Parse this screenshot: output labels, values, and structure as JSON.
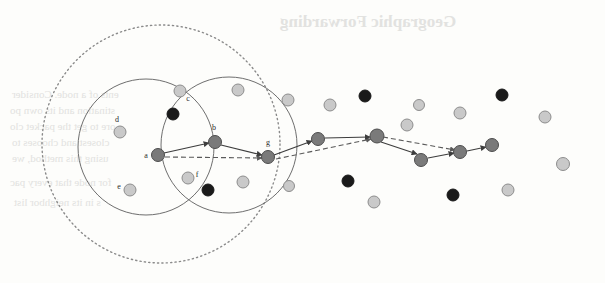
{
  "figure": {
    "background_color": "#fdfdfb",
    "colors": {
      "light_node": "#c9c9c9",
      "light_node_stroke": "#8d8d8d",
      "mid_node": "#7a7a7a",
      "mid_node_stroke": "#4d4d4d",
      "dark_node": "#1a1a1a",
      "circle_stroke": "#6e6e6e",
      "dotted_stroke": "#8a8a8a",
      "edge_solid": "#3d3d3d",
      "edge_dashed": "#5a5a5a",
      "label_color": "#2b2b2b",
      "bleed_text": "#e2e2e0"
    },
    "regions": {
      "dotted_circle": {
        "cx": 161,
        "cy": 144,
        "r": 119,
        "style": "dotted"
      },
      "solid_circle_left": {
        "cx": 146,
        "cy": 147,
        "r": 68,
        "style": "solid"
      },
      "solid_circle_right": {
        "cx": 229,
        "cy": 145,
        "r": 68,
        "style": "solid"
      }
    },
    "labeled_nodes": [
      {
        "id": "a",
        "x": 158,
        "y": 155,
        "r": 6.5,
        "kind": "mid",
        "label": "a",
        "lx": 146,
        "ly": 158
      },
      {
        "id": "b",
        "x": 215,
        "y": 142,
        "r": 6.5,
        "kind": "mid",
        "label": "b",
        "lx": 214,
        "ly": 130
      },
      {
        "id": "c",
        "x": 180,
        "y": 91,
        "r": 6.0,
        "kind": "light",
        "label": "c",
        "lx": 188,
        "ly": 101
      },
      {
        "id": "d",
        "x": 120,
        "y": 132,
        "r": 6.0,
        "kind": "light",
        "label": "d",
        "lx": 117,
        "ly": 122
      },
      {
        "id": "e",
        "x": 130,
        "y": 190,
        "r": 6.0,
        "kind": "light",
        "label": "e",
        "lx": 119,
        "ly": 189
      },
      {
        "id": "f",
        "x": 188,
        "y": 178,
        "r": 6.0,
        "kind": "light",
        "label": "f",
        "lx": 197,
        "ly": 177
      },
      {
        "id": "g",
        "x": 268,
        "y": 157,
        "r": 6.5,
        "kind": "mid",
        "label": "g",
        "lx": 268,
        "ly": 145
      }
    ],
    "path_nodes": [
      {
        "id": "p1",
        "x": 318,
        "y": 139,
        "r": 6.5,
        "kind": "mid"
      },
      {
        "id": "p2",
        "x": 377,
        "y": 136,
        "r": 7.0,
        "kind": "mid"
      },
      {
        "id": "p3",
        "x": 421,
        "y": 160,
        "r": 6.5,
        "kind": "mid"
      },
      {
        "id": "p4",
        "x": 460,
        "y": 152,
        "r": 6.5,
        "kind": "mid"
      },
      {
        "id": "p5",
        "x": 492,
        "y": 145,
        "r": 6.5,
        "kind": "mid"
      }
    ],
    "scatter_nodes": [
      {
        "x": 238,
        "y": 90,
        "r": 6.0,
        "kind": "light"
      },
      {
        "x": 173,
        "y": 114,
        "r": 6.0,
        "kind": "dark"
      },
      {
        "x": 208,
        "y": 190,
        "r": 6.0,
        "kind": "dark"
      },
      {
        "x": 243,
        "y": 182,
        "r": 6.0,
        "kind": "light"
      },
      {
        "x": 288,
        "y": 100,
        "r": 6.0,
        "kind": "light"
      },
      {
        "x": 289,
        "y": 186,
        "r": 5.5,
        "kind": "light"
      },
      {
        "x": 330,
        "y": 105,
        "r": 6.0,
        "kind": "light"
      },
      {
        "x": 348,
        "y": 181,
        "r": 6.0,
        "kind": "dark"
      },
      {
        "x": 365,
        "y": 96,
        "r": 6.0,
        "kind": "dark"
      },
      {
        "x": 374,
        "y": 202,
        "r": 6.0,
        "kind": "light"
      },
      {
        "x": 407,
        "y": 125,
        "r": 6.0,
        "kind": "light"
      },
      {
        "x": 419,
        "y": 105,
        "r": 5.5,
        "kind": "light"
      },
      {
        "x": 453,
        "y": 195,
        "r": 6.0,
        "kind": "dark"
      },
      {
        "x": 460,
        "y": 113,
        "r": 6.0,
        "kind": "light"
      },
      {
        "x": 502,
        "y": 95,
        "r": 6.0,
        "kind": "dark"
      },
      {
        "x": 508,
        "y": 190,
        "r": 6.0,
        "kind": "light"
      },
      {
        "x": 545,
        "y": 117,
        "r": 6.0,
        "kind": "light"
      },
      {
        "x": 563,
        "y": 164,
        "r": 6.5,
        "kind": "light"
      },
      {
        "x": 512,
        "y": 193,
        "r": 0.1,
        "kind": "light"
      },
      {
        "x": 282,
        "y": 137,
        "r": 0.1,
        "kind": "light"
      }
    ],
    "solid_edges": [
      {
        "from": "a",
        "to": "b",
        "x1": 164,
        "y1": 153,
        "x2": 209,
        "y2": 143
      },
      {
        "from": "b",
        "to": "g",
        "x1": 221,
        "y1": 145,
        "x2": 262,
        "y2": 155
      },
      {
        "from": "g",
        "to": "p1",
        "x1": 274,
        "y1": 155,
        "x2": 312,
        "y2": 141
      },
      {
        "from": "p1",
        "to": "p2",
        "x1": 325,
        "y1": 138,
        "x2": 370,
        "y2": 137
      },
      {
        "from": "p2",
        "to": "p3",
        "x1": 381,
        "y1": 142,
        "x2": 417,
        "y2": 154
      },
      {
        "from": "p3",
        "to": "p4",
        "x1": 428,
        "y1": 158,
        "x2": 454,
        "y2": 153
      },
      {
        "from": "p4",
        "to": "p5",
        "x1": 467,
        "y1": 151,
        "x2": 486,
        "y2": 147
      }
    ],
    "dashed_edges": [
      {
        "from": "a",
        "to": "g",
        "x1": 165,
        "y1": 157,
        "x2": 262,
        "y2": 158
      },
      {
        "from": "g",
        "to": "p2",
        "x1": 276,
        "y1": 159,
        "x2": 371,
        "y2": 139
      },
      {
        "from": "p2",
        "to": "p4",
        "x1": 383,
        "y1": 137,
        "x2": 455,
        "y2": 150
      }
    ],
    "bleed_text_lines": [
      {
        "text": "Geographic Forwarding",
        "x": 280,
        "y": 12,
        "size": 17,
        "weight": "700"
      },
      {
        "text": "ents of a node. Consider",
        "x": 12,
        "y": 88,
        "size": 11,
        "weight": "400"
      },
      {
        "text": "stination and its own po",
        "x": 10,
        "y": 104,
        "size": 11,
        "weight": "400"
      },
      {
        "text": "ore to get the packet clo",
        "x": 10,
        "y": 120,
        "size": 11,
        "weight": "400"
      },
      {
        "text": "closest and chooses to",
        "x": 12,
        "y": 136,
        "size": 11,
        "weight": "400"
      },
      {
        "text": "using this method, we",
        "x": 12,
        "y": 152,
        "size": 11,
        "weight": "400"
      },
      {
        "text": "for node that every pac",
        "x": 10,
        "y": 176,
        "size": 11,
        "weight": "400"
      },
      {
        "text": "s in its neighbor list",
        "x": 14,
        "y": 196,
        "size": 11,
        "weight": "400"
      }
    ]
  }
}
